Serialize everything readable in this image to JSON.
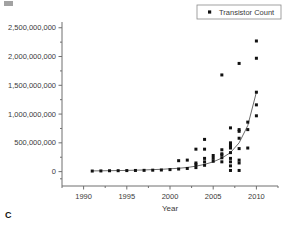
{
  "panel": {
    "letter": "C"
  },
  "legend": {
    "position": "top-right",
    "marker": "square-marker-icon",
    "entries": [
      {
        "label": "Transistor Count"
      }
    ]
  },
  "axes": {
    "x": {
      "label": "Year",
      "ticks": [
        1990,
        1995,
        2000,
        2005,
        2010
      ],
      "tick_labels": [
        "1990",
        "1995",
        "2000",
        "2005",
        "2010"
      ],
      "min": 1987.5,
      "max": 2012.5
    },
    "y": {
      "label": "",
      "ticks": [
        0,
        500000000,
        1000000000,
        1500000000,
        2000000000,
        2500000000
      ],
      "tick_labels": [
        "0",
        "500,000,000",
        "1,000,000,000",
        "1,500,000,000",
        "2,000,000,000",
        "2,500,000,000"
      ],
      "min": -250000000,
      "max": 2600000000
    }
  },
  "colors": {
    "marker": "#111111",
    "curve": "#6b6b6b",
    "axis": "#6f6f6f",
    "text": "#3a3a3a",
    "background": "#ffffff"
  },
  "chart_data": {
    "type": "scatter",
    "title": "",
    "xlabel": "Year",
    "ylabel": "",
    "xlim": [
      1987.5,
      2012.5
    ],
    "ylim": [
      -250000000,
      2600000000
    ],
    "grid": false,
    "legend_position": "top-right",
    "series": [
      {
        "name": "Transistor Count",
        "marker": "square",
        "color": "#111111",
        "points": [
          [
            1991,
            10000000
          ],
          [
            1992,
            12000000
          ],
          [
            1993,
            15000000
          ],
          [
            1994,
            16000000
          ],
          [
            1995,
            18000000
          ],
          [
            1996,
            20000000
          ],
          [
            1997,
            22000000
          ],
          [
            1998,
            25000000
          ],
          [
            1999,
            28000000
          ],
          [
            2000,
            35000000
          ],
          [
            2001,
            45000000
          ],
          [
            2001,
            190000000
          ],
          [
            2002,
            55000000
          ],
          [
            2002,
            200000000
          ],
          [
            2003,
            70000000
          ],
          [
            2003,
            120000000
          ],
          [
            2003,
            150000000
          ],
          [
            2003,
            390000000
          ],
          [
            2004,
            110000000
          ],
          [
            2004,
            170000000
          ],
          [
            2004,
            230000000
          ],
          [
            2004,
            390000000
          ],
          [
            2004,
            560000000
          ],
          [
            2005,
            180000000
          ],
          [
            2005,
            230000000
          ],
          [
            2005,
            280000000
          ],
          [
            2006,
            170000000
          ],
          [
            2006,
            240000000
          ],
          [
            2006,
            290000000
          ],
          [
            2006,
            310000000
          ],
          [
            2006,
            380000000
          ],
          [
            2006,
            1680000000
          ],
          [
            2007,
            20000000
          ],
          [
            2007,
            100000000
          ],
          [
            2007,
            170000000
          ],
          [
            2007,
            230000000
          ],
          [
            2007,
            330000000
          ],
          [
            2007,
            410000000
          ],
          [
            2007,
            430000000
          ],
          [
            2007,
            460000000
          ],
          [
            2007,
            500000000
          ],
          [
            2007,
            760000000
          ],
          [
            2008,
            20000000
          ],
          [
            2008,
            150000000
          ],
          [
            2008,
            200000000
          ],
          [
            2008,
            400000000
          ],
          [
            2008,
            580000000
          ],
          [
            2008,
            700000000
          ],
          [
            2008,
            730000000
          ],
          [
            2008,
            1880000000
          ],
          [
            2009,
            410000000
          ],
          [
            2009,
            730000000
          ],
          [
            2009,
            860000000
          ],
          [
            2010,
            970000000
          ],
          [
            2010,
            1160000000
          ],
          [
            2010,
            1380000000
          ],
          [
            2010,
            1970000000
          ],
          [
            2010,
            2270000000
          ]
        ]
      }
    ],
    "fit_curve": {
      "name": "exponential fit",
      "color": "#6b6b6b",
      "points": [
        [
          1991,
          12000000
        ],
        [
          1993,
          16000000
        ],
        [
          1995,
          21000000
        ],
        [
          1997,
          29000000
        ],
        [
          1999,
          40000000
        ],
        [
          2001,
          58000000
        ],
        [
          2002,
          72000000
        ],
        [
          2003,
          95000000
        ],
        [
          2004,
          125000000
        ],
        [
          2005,
          170000000
        ],
        [
          2006,
          235000000
        ],
        [
          2007,
          330000000
        ],
        [
          2008,
          500000000
        ],
        [
          2009,
          800000000
        ],
        [
          2010,
          1380000000
        ]
      ]
    }
  }
}
